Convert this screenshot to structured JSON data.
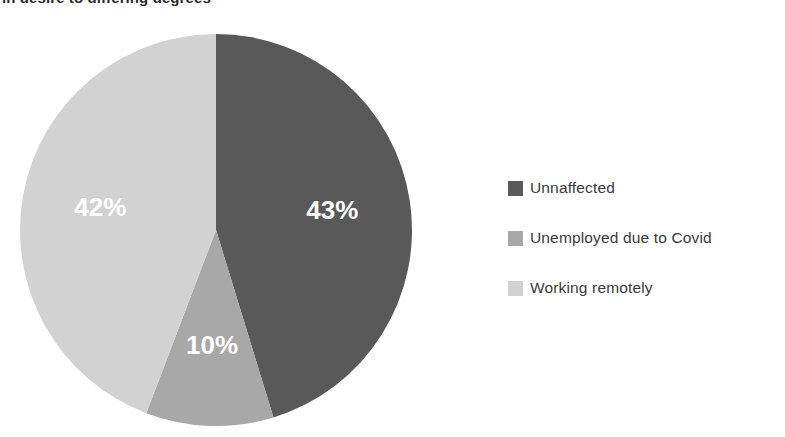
{
  "caption": {
    "text": "in desire to differing degrees"
  },
  "legend": {
    "items": [
      {
        "label": "Unnaffected",
        "color": "#595959"
      },
      {
        "label": "Unemployed due to Covid",
        "color": "#a8a8a8"
      },
      {
        "label": "Working remotely",
        "color": "#d2d2d2"
      }
    ]
  },
  "chart_data": {
    "type": "pie",
    "title": "in desire to differing degrees",
    "categories": [
      "Unnaffected",
      "Unemployed due to Covid",
      "Working remotely"
    ],
    "values": [
      43,
      10,
      42
    ],
    "value_labels": [
      "43%",
      "10%",
      "42%"
    ],
    "colors": [
      "#595959",
      "#a8a8a8",
      "#d2d2d2"
    ],
    "units": "percent",
    "start_angle_deg": 0,
    "direction": "clockwise",
    "legend_position": "right",
    "grid": false,
    "label_color": "#ffffff",
    "xlabel": "",
    "ylabel": ""
  }
}
